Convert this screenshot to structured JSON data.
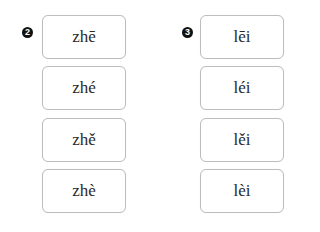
{
  "groups": [
    {
      "number": "2",
      "options": [
        "zhē",
        "zhé",
        "zhě",
        "zhè"
      ]
    },
    {
      "number": "3",
      "options": [
        "lēi",
        "léi",
        "lěi",
        "lèi"
      ]
    }
  ]
}
